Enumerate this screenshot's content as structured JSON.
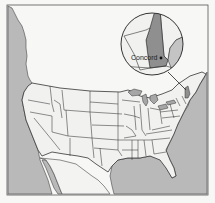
{
  "map": {
    "title": "Location of Concord, New Hampshire",
    "region": "United States",
    "highlight_state": "New Hampshire",
    "colors": {
      "water": "#b9b9b9",
      "land": "#f1f1f0",
      "highlight": "#8f8f8f",
      "neighbor": "#c4c4c4",
      "border": "#3a3a3a",
      "background": "#f7f7f5"
    },
    "inset": {
      "city_label": "Concord",
      "marker": "city-dot"
    }
  }
}
